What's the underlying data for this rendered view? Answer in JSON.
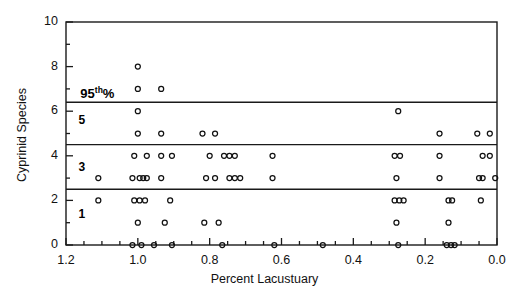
{
  "chart_data": {
    "type": "scatter",
    "title": "",
    "xlabel": "Percent Lacustuary",
    "ylabel": "Cyprinid Species",
    "xlim": [
      1.2,
      0.0
    ],
    "ylim": [
      0,
      10
    ],
    "x_reversed": true,
    "xticks": [
      1.2,
      1.0,
      0.8,
      0.6,
      0.4,
      0.2,
      0.0
    ],
    "xtick_labels": [
      "1.2",
      "1.0",
      "0.8",
      "0.6",
      "0.4",
      "0.2",
      "0.0"
    ],
    "x_minor_step": 0.05,
    "yticks": [
      0,
      2,
      4,
      6,
      8,
      10
    ],
    "ytick_labels": [
      "0",
      "2",
      "4",
      "6",
      "8",
      "10"
    ],
    "y_minor_step": 1,
    "grid": false,
    "legend": null,
    "marker": "open-circle",
    "marker_size": 5,
    "reference_lines": [
      {
        "y": 6.4,
        "label": "95th%",
        "label_x": 1.16
      },
      {
        "y": 4.5,
        "label": "",
        "label_x": null
      },
      {
        "y": 2.5,
        "label": "",
        "label_x": null
      }
    ],
    "zone_labels": [
      {
        "text": "5",
        "x": 1.165,
        "y": 5.55
      },
      {
        "text": "3",
        "x": 1.165,
        "y": 3.45
      },
      {
        "text": "1",
        "x": 1.165,
        "y": 1.35
      }
    ],
    "points": [
      {
        "x": 1.0,
        "y": 8
      },
      {
        "x": 1.0,
        "y": 7
      },
      {
        "x": 0.935,
        "y": 7
      },
      {
        "x": 1.0,
        "y": 6
      },
      {
        "x": 0.275,
        "y": 6
      },
      {
        "x": 1.0,
        "y": 5
      },
      {
        "x": 0.935,
        "y": 5
      },
      {
        "x": 0.82,
        "y": 5
      },
      {
        "x": 0.785,
        "y": 5
      },
      {
        "x": 0.16,
        "y": 5
      },
      {
        "x": 0.055,
        "y": 5
      },
      {
        "x": 0.02,
        "y": 5
      },
      {
        "x": 1.01,
        "y": 4
      },
      {
        "x": 0.975,
        "y": 4
      },
      {
        "x": 0.935,
        "y": 4
      },
      {
        "x": 0.905,
        "y": 4
      },
      {
        "x": 0.8,
        "y": 4
      },
      {
        "x": 0.76,
        "y": 4
      },
      {
        "x": 0.745,
        "y": 4
      },
      {
        "x": 0.73,
        "y": 4
      },
      {
        "x": 0.625,
        "y": 4
      },
      {
        "x": 0.285,
        "y": 4
      },
      {
        "x": 0.27,
        "y": 4
      },
      {
        "x": 0.16,
        "y": 4
      },
      {
        "x": 0.04,
        "y": 4
      },
      {
        "x": 0.02,
        "y": 4
      },
      {
        "x": 1.11,
        "y": 3
      },
      {
        "x": 1.015,
        "y": 3
      },
      {
        "x": 0.995,
        "y": 3
      },
      {
        "x": 0.985,
        "y": 3
      },
      {
        "x": 0.975,
        "y": 3
      },
      {
        "x": 0.935,
        "y": 3
      },
      {
        "x": 0.81,
        "y": 3
      },
      {
        "x": 0.785,
        "y": 3
      },
      {
        "x": 0.745,
        "y": 3
      },
      {
        "x": 0.73,
        "y": 3
      },
      {
        "x": 0.715,
        "y": 3
      },
      {
        "x": 0.625,
        "y": 3
      },
      {
        "x": 0.28,
        "y": 3
      },
      {
        "x": 0.16,
        "y": 3
      },
      {
        "x": 0.05,
        "y": 3
      },
      {
        "x": 0.04,
        "y": 3
      },
      {
        "x": 0.005,
        "y": 3
      },
      {
        "x": 1.11,
        "y": 2
      },
      {
        "x": 1.01,
        "y": 2
      },
      {
        "x": 0.995,
        "y": 2
      },
      {
        "x": 0.98,
        "y": 2
      },
      {
        "x": 0.91,
        "y": 2
      },
      {
        "x": 0.285,
        "y": 2
      },
      {
        "x": 0.272,
        "y": 2
      },
      {
        "x": 0.26,
        "y": 2
      },
      {
        "x": 0.135,
        "y": 2
      },
      {
        "x": 0.125,
        "y": 2
      },
      {
        "x": 0.045,
        "y": 2
      },
      {
        "x": 1.0,
        "y": 1
      },
      {
        "x": 0.925,
        "y": 1
      },
      {
        "x": 0.815,
        "y": 1
      },
      {
        "x": 0.775,
        "y": 1
      },
      {
        "x": 0.28,
        "y": 1
      },
      {
        "x": 0.135,
        "y": 1
      },
      {
        "x": 1.015,
        "y": 0
      },
      {
        "x": 0.99,
        "y": 0
      },
      {
        "x": 0.955,
        "y": 0
      },
      {
        "x": 0.905,
        "y": 0
      },
      {
        "x": 0.765,
        "y": 0
      },
      {
        "x": 0.62,
        "y": 0
      },
      {
        "x": 0.485,
        "y": 0
      },
      {
        "x": 0.275,
        "y": 0
      },
      {
        "x": 0.14,
        "y": 0
      },
      {
        "x": 0.128,
        "y": 0
      },
      {
        "x": 0.118,
        "y": 0
      }
    ]
  }
}
